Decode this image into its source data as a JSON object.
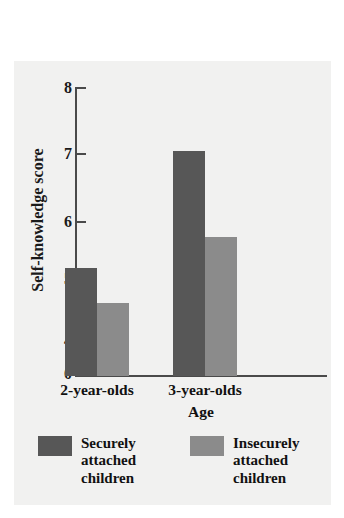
{
  "figure": {
    "background_color": "#f1f1f0",
    "page_background_color": "#ffffff"
  },
  "chart_data": {
    "type": "bar",
    "title": "",
    "xlabel": "Age",
    "ylabel": "Self-knowledge score",
    "categories": [
      "2-year-olds",
      "3-year-olds"
    ],
    "series": [
      {
        "name": "Securely attached children",
        "name_lines": [
          "Securely",
          "attached",
          "children"
        ],
        "color": "#575757",
        "values": [
          5.15,
          7.0
        ]
      },
      {
        "name": "Insecurely attached children",
        "name_lines": [
          "Insecurely",
          "attached",
          "children"
        ],
        "color": "#8b8b8b",
        "values": [
          4.6,
          5.65
        ]
      }
    ],
    "ylim": [
      0,
      8
    ],
    "y_axis_break": true,
    "y_axis_break_between": [
      0,
      4
    ],
    "yticks": [
      8,
      7,
      6,
      5,
      4,
      0
    ],
    "ytick_labels": [
      "8",
      "7",
      "6",
      "5",
      "4",
      "0"
    ],
    "grid": false,
    "legend_position": "below"
  },
  "axis": {
    "tick_labels": [
      "8",
      "7",
      "6",
      "5",
      "4",
      "0"
    ],
    "y_title": "Self-knowledge score",
    "x_title": "Age",
    "category_labels": [
      "2-year-olds",
      "3-year-olds"
    ]
  },
  "legend": {
    "items": [
      {
        "line1": "Securely",
        "line2": "attached",
        "line3": "children",
        "color": "#575757"
      },
      {
        "line1": "Insecurely",
        "line2": "attached",
        "line3": "children",
        "color": "#8b8b8b"
      }
    ]
  }
}
